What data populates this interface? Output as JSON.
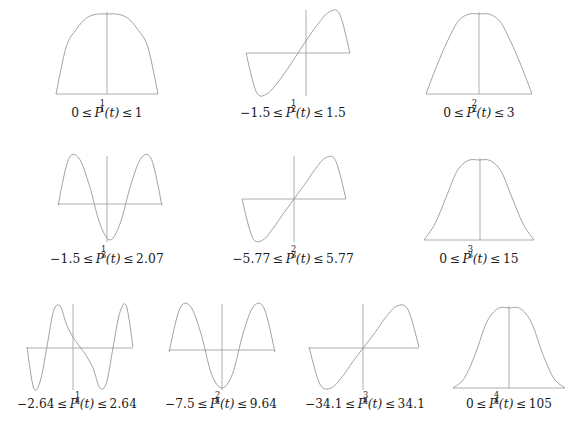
{
  "figure": {
    "background_color": "#ffffff",
    "curve_color": "#8a8a8a",
    "axis_color": "#9a9a9a",
    "text_color": "#1a1a1a",
    "rows": [
      {
        "row_index": 1,
        "plots": [
          {
            "id": "P_1_1",
            "symbol_base": "P",
            "symbol_sub": "1",
            "symbol_sup": "1",
            "lower": "0",
            "upper": "1",
            "caption": "0 ≤ P₁¹(t) ≤ 1",
            "shape": "half-sine-hump",
            "axis_y_fraction": 0.5,
            "baseline_fraction": 1.0
          },
          {
            "id": "P_2_1",
            "symbol_base": "P",
            "symbol_sub": "2",
            "symbol_sup": "1",
            "lower": "−1.5",
            "upper": "1.5",
            "caption": "−1.5 ≤ P₂¹(t) ≤ 1.5",
            "shape": "full-sine-odd",
            "axis_y_fraction": 0.5,
            "baseline_fraction": 0.5
          },
          {
            "id": "P_2_2",
            "symbol_base": "P",
            "symbol_sub": "2",
            "symbol_sup": "2",
            "lower": "0",
            "upper": "3",
            "caption": "0 ≤ P₂²(t) ≤ 3",
            "shape": "sin-squared-hump",
            "axis_y_fraction": 0.5,
            "baseline_fraction": 1.0
          }
        ]
      },
      {
        "row_index": 2,
        "plots": [
          {
            "id": "P_3_1",
            "symbol_base": "P",
            "symbol_sub": "3",
            "symbol_sup": "1",
            "lower": "−1.5",
            "upper": "2.07",
            "caption": "−1.5 ≤ P₃¹(t) ≤ 2.07",
            "shape": "even-two-peaks-one-trough",
            "axis_y_fraction": 0.42,
            "baseline_fraction": 0.42
          },
          {
            "id": "P_3_2",
            "symbol_base": "P",
            "symbol_sub": "3",
            "symbol_sup": "2",
            "lower": "−5.77",
            "upper": "5.77",
            "caption": "−5.77 ≤ P₃²(t) ≤ 5.77",
            "shape": "odd-single-period",
            "axis_y_fraction": 0.5,
            "baseline_fraction": 0.5
          },
          {
            "id": "P_3_3",
            "symbol_base": "P",
            "symbol_sub": "3",
            "symbol_sup": "3",
            "lower": "0",
            "upper": "15",
            "caption": "0 ≤ P₃³(t) ≤ 15",
            "shape": "sin-cubed-hump",
            "axis_y_fraction": 0.5,
            "baseline_fraction": 1.0
          }
        ]
      },
      {
        "row_index": 3,
        "plots": [
          {
            "id": "P_4_1",
            "symbol_base": "P",
            "symbol_sub": "4",
            "symbol_sup": "1",
            "lower": "−2.64",
            "upper": "2.64",
            "caption": "−2.64 ≤ P₄¹(t) ≤ 2.64",
            "shape": "odd-two-periods",
            "axis_y_fraction": 0.5,
            "baseline_fraction": 0.5
          },
          {
            "id": "P_4_2",
            "symbol_base": "P",
            "symbol_sub": "4",
            "symbol_sup": "2",
            "lower": "−7.5",
            "upper": "9.64",
            "caption": "−7.5 ≤ P₄²(t) ≤ 9.64",
            "shape": "even-two-peaks-deep-center-trough",
            "axis_y_fraction": 0.44,
            "baseline_fraction": 0.44
          },
          {
            "id": "P_4_3",
            "symbol_base": "P",
            "symbol_sub": "4",
            "symbol_sup": "3",
            "lower": "−34.1",
            "upper": "34.1",
            "caption": "−34.1 ≤ P₄³(t) ≤ 34.1",
            "shape": "odd-single-period",
            "axis_y_fraction": 0.5,
            "baseline_fraction": 0.5
          },
          {
            "id": "P_4_4",
            "symbol_base": "P",
            "symbol_sub": "4",
            "symbol_sup": "4",
            "lower": "0",
            "upper": "105",
            "caption": "0 ≤ P₄⁴(t) ≤ 105",
            "shape": "sin-fourth-bell",
            "axis_y_fraction": 0.5,
            "baseline_fraction": 1.0
          }
        ]
      }
    ]
  },
  "chart_data": [
    {
      "type": "line",
      "title": "P_1^1(t)",
      "xlabel": "t",
      "ylabel": "",
      "legend": [],
      "grid": false,
      "xlim": [
        -1,
        1
      ],
      "ylim": [
        0,
        1
      ],
      "annotation": "0 ≤ P₁¹(t) ≤ 1",
      "x": [
        -1,
        -0.8,
        -0.6,
        -0.4,
        -0.2,
        0,
        0.2,
        0.4,
        0.6,
        0.8,
        1
      ],
      "y": [
        0,
        0.588,
        0.809,
        0.951,
        0.998,
        1,
        0.998,
        0.951,
        0.809,
        0.588,
        0
      ]
    },
    {
      "type": "line",
      "title": "P_2^1(t)",
      "xlabel": "t",
      "ylabel": "",
      "legend": [],
      "grid": false,
      "xlim": [
        -1,
        1
      ],
      "ylim": [
        -1.5,
        1.5
      ],
      "annotation": "−1.5 ≤ P₂¹(t) ≤ 1.5",
      "x": [
        -1,
        -0.8,
        -0.6,
        -0.4,
        -0.2,
        0,
        0.2,
        0.4,
        0.6,
        0.8,
        1
      ],
      "y": [
        0,
        -1.43,
        -1.5,
        -1.1,
        -0.58,
        0,
        0.58,
        1.1,
        1.5,
        1.43,
        0
      ]
    },
    {
      "type": "line",
      "title": "P_2^2(t)",
      "xlabel": "t",
      "ylabel": "",
      "legend": [],
      "grid": false,
      "xlim": [
        -1,
        1
      ],
      "ylim": [
        0,
        3
      ],
      "annotation": "0 ≤ P₂²(t) ≤ 3",
      "x": [
        -1,
        -0.8,
        -0.6,
        -0.4,
        -0.2,
        0,
        0.2,
        0.4,
        0.6,
        0.8,
        1
      ],
      "y": [
        0,
        1.04,
        1.96,
        2.71,
        2.99,
        3,
        2.99,
        2.71,
        1.96,
        1.04,
        0
      ]
    },
    {
      "type": "line",
      "title": "P_3^1(t)",
      "xlabel": "t",
      "ylabel": "",
      "legend": [],
      "grid": false,
      "xlim": [
        -1,
        1
      ],
      "ylim": [
        -1.5,
        2.07
      ],
      "annotation": "−1.5 ≤ P₃¹(t) ≤ 2.07",
      "x": [
        -1,
        -0.8,
        -0.6,
        -0.4,
        -0.2,
        0,
        0.2,
        0.4,
        0.6,
        0.8,
        1
      ],
      "y": [
        0,
        2.0,
        2.07,
        0.9,
        -0.75,
        -1.5,
        -0.75,
        0.9,
        2.07,
        2.0,
        0
      ]
    },
    {
      "type": "line",
      "title": "P_3^2(t)",
      "xlabel": "t",
      "ylabel": "",
      "legend": [],
      "grid": false,
      "xlim": [
        -1,
        1
      ],
      "ylim": [
        -5.77,
        5.77
      ],
      "annotation": "−5.77 ≤ P₃²(t) ≤ 5.77",
      "x": [
        -1,
        -0.8,
        -0.6,
        -0.4,
        -0.2,
        0,
        0.2,
        0.4,
        0.6,
        0.8,
        1
      ],
      "y": [
        0,
        -5.4,
        -5.77,
        -4.1,
        -2.0,
        0,
        2.0,
        4.1,
        5.77,
        5.4,
        0
      ]
    },
    {
      "type": "line",
      "title": "P_3^3(t)",
      "xlabel": "t",
      "ylabel": "",
      "legend": [],
      "grid": false,
      "xlim": [
        -1,
        1
      ],
      "ylim": [
        0,
        15
      ],
      "annotation": "0 ≤ P₃³(t) ≤ 15",
      "x": [
        -1,
        -0.8,
        -0.6,
        -0.4,
        -0.2,
        0,
        0.2,
        0.4,
        0.6,
        0.8,
        1
      ],
      "y": [
        0,
        3.05,
        7.95,
        12.9,
        14.9,
        15,
        14.9,
        12.9,
        7.95,
        3.05,
        0
      ]
    },
    {
      "type": "line",
      "title": "P_4^1(t)",
      "xlabel": "t",
      "ylabel": "",
      "legend": [],
      "grid": false,
      "xlim": [
        -1,
        1
      ],
      "ylim": [
        -2.64,
        2.64
      ],
      "annotation": "−2.64 ≤ P₄¹(t) ≤ 2.64",
      "x": [
        -1,
        -0.875,
        -0.75,
        -0.625,
        -0.5,
        -0.375,
        -0.25,
        -0.125,
        0,
        0.125,
        0.25,
        0.375,
        0.5,
        0.625,
        0.75,
        0.875,
        1
      ],
      "y": [
        0,
        -2.64,
        -2.2,
        0,
        2.3,
        2.64,
        1.4,
        0.6,
        0,
        -0.6,
        -1.4,
        -2.64,
        -2.3,
        0,
        2.2,
        2.64,
        0
      ]
    },
    {
      "type": "line",
      "title": "P_4^2(t)",
      "xlabel": "t",
      "ylabel": "",
      "legend": [],
      "grid": false,
      "xlim": [
        -1,
        1
      ],
      "ylim": [
        -7.5,
        9.64
      ],
      "annotation": "−7.5 ≤ P₄²(t) ≤ 9.64",
      "x": [
        -1,
        -0.8,
        -0.6,
        -0.4,
        -0.2,
        0,
        0.2,
        0.4,
        0.6,
        0.8,
        1
      ],
      "y": [
        0,
        9.0,
        9.64,
        4.0,
        -4.5,
        -7.5,
        -4.5,
        4.0,
        9.64,
        9.0,
        0
      ]
    },
    {
      "type": "line",
      "title": "P_4^3(t)",
      "xlabel": "t",
      "ylabel": "",
      "legend": [],
      "grid": false,
      "xlim": [
        -1,
        1
      ],
      "ylim": [
        -34.1,
        34.1
      ],
      "annotation": "−34.1 ≤ P₄³(t) ≤ 34.1",
      "x": [
        -1,
        -0.8,
        -0.6,
        -0.4,
        -0.2,
        0,
        0.2,
        0.4,
        0.6,
        0.8,
        1
      ],
      "y": [
        0,
        -31.0,
        -34.1,
        -25.0,
        -12.0,
        0,
        12.0,
        25.0,
        34.1,
        31.0,
        0
      ]
    },
    {
      "type": "line",
      "title": "P_4^4(t)",
      "xlabel": "t",
      "ylabel": "",
      "legend": [],
      "grid": false,
      "xlim": [
        -1,
        1
      ],
      "ylim": [
        0,
        105
      ],
      "annotation": "0 ≤ P₄⁴(t) ≤ 105",
      "x": [
        -1,
        -0.8,
        -0.6,
        -0.4,
        -0.2,
        0,
        0.2,
        0.4,
        0.6,
        0.8,
        1
      ],
      "y": [
        0,
        12.7,
        45.0,
        86.0,
        104.3,
        105,
        104.3,
        86.0,
        45.0,
        12.7,
        0
      ]
    }
  ]
}
